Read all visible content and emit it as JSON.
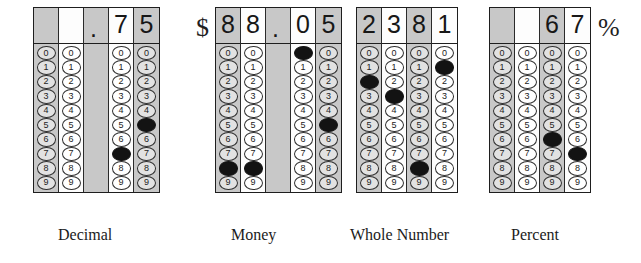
{
  "page": {
    "bubble_digits": [
      "0",
      "1",
      "2",
      "3",
      "4",
      "5",
      "6",
      "7",
      "8",
      "9"
    ]
  },
  "grids": [
    {
      "id": "decimal",
      "caption": "Decimal",
      "prefix_symbol": "",
      "suffix_symbol": "",
      "answer": ".75",
      "left": 33,
      "caption_left": 58,
      "columns": [
        {
          "shade": "gray",
          "header": "",
          "filled": null,
          "blank": false
        },
        {
          "shade": "white",
          "header": "",
          "filled": null,
          "blank": false
        },
        {
          "shade": "gray",
          "header": ".",
          "filled": null,
          "blank": true,
          "is_dot": true
        },
        {
          "shade": "white",
          "header": "7",
          "filled": 7,
          "blank": false
        },
        {
          "shade": "gray",
          "header": "5",
          "filled": 5,
          "blank": false
        }
      ]
    },
    {
      "id": "money",
      "caption": "Money",
      "prefix_symbol": "$",
      "suffix_symbol": "",
      "answer": "88.05",
      "left": 196,
      "caption_left": 231,
      "columns": [
        {
          "shade": "gray",
          "header": "8",
          "filled": 8,
          "blank": false
        },
        {
          "shade": "white",
          "header": "8",
          "filled": 8,
          "blank": false
        },
        {
          "shade": "gray",
          "header": ".",
          "filled": null,
          "blank": true,
          "is_dot": true
        },
        {
          "shade": "white",
          "header": "0",
          "filled": 0,
          "blank": false
        },
        {
          "shade": "gray",
          "header": "5",
          "filled": 5,
          "blank": false
        }
      ]
    },
    {
      "id": "whole-number",
      "caption": "Whole Number",
      "prefix_symbol": "",
      "suffix_symbol": "",
      "answer": "2381",
      "left": 356,
      "caption_left": 350,
      "columns": [
        {
          "shade": "gray",
          "header": "2",
          "filled": 2,
          "blank": false
        },
        {
          "shade": "white",
          "header": "3",
          "filled": 3,
          "blank": false
        },
        {
          "shade": "gray",
          "header": "8",
          "filled": 8,
          "blank": false
        },
        {
          "shade": "white",
          "header": "1",
          "filled": 1,
          "blank": false
        }
      ]
    },
    {
      "id": "percent",
      "caption": "Percent",
      "prefix_symbol": "",
      "suffix_symbol": "%",
      "answer": "67",
      "left": 489,
      "caption_left": 511,
      "columns": [
        {
          "shade": "gray",
          "header": "",
          "filled": null,
          "blank": false
        },
        {
          "shade": "white",
          "header": "",
          "filled": null,
          "blank": false
        },
        {
          "shade": "gray",
          "header": "6",
          "filled": 6,
          "blank": false
        },
        {
          "shade": "white",
          "header": "7",
          "filled": 7,
          "blank": false
        }
      ]
    }
  ]
}
